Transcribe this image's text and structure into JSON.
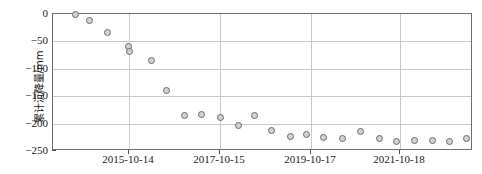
{
  "chart_data": {
    "type": "scatter",
    "title": "",
    "xlabel": "",
    "ylabel": "累计沉降量/mm",
    "ylim": [
      -250,
      0
    ],
    "yticks": [
      0,
      -50,
      -100,
      -150,
      -200,
      -250
    ],
    "ytick_labels": [
      "0",
      "−050",
      "−100",
      "−150",
      "−200",
      "−250"
    ],
    "xtick_labels": [
      "2015-10-14",
      "2017-10-15",
      "2019-10-17",
      "2021-10-18"
    ],
    "xtick_positions": [
      128,
      219,
      310,
      399
    ],
    "grid": "horizontal-and-vertical",
    "legend": "none",
    "marker": {
      "shape": "circle",
      "face_color": "#d2d2d2",
      "edge_color": "#6a6a6a",
      "size_px": 7
    },
    "axis_color": "#6e6e6e",
    "grid_color": "#c9c9c9",
    "points": [
      {
        "px": 74,
        "value": 0
      },
      {
        "px": 88,
        "value": -11
      },
      {
        "px": 106,
        "value": -33
      },
      {
        "px": 127,
        "value": -60
      },
      {
        "px": 128,
        "value": -69
      },
      {
        "px": 150,
        "value": -84
      },
      {
        "px": 165,
        "value": -139
      },
      {
        "px": 183,
        "value": -186
      },
      {
        "px": 200,
        "value": -184
      },
      {
        "px": 219,
        "value": -188
      },
      {
        "px": 237,
        "value": -204
      },
      {
        "px": 253,
        "value": -186
      },
      {
        "px": 270,
        "value": -213
      },
      {
        "px": 289,
        "value": -224
      },
      {
        "px": 305,
        "value": -219
      },
      {
        "px": 322,
        "value": -226
      },
      {
        "px": 341,
        "value": -228
      },
      {
        "px": 359,
        "value": -215
      },
      {
        "px": 378,
        "value": -228
      },
      {
        "px": 395,
        "value": -233
      },
      {
        "px": 413,
        "value": -230
      },
      {
        "px": 431,
        "value": -230
      },
      {
        "px": 448,
        "value": -232
      },
      {
        "px": 465,
        "value": -228
      }
    ]
  }
}
